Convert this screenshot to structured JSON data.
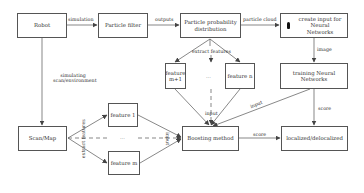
{
  "nodes": {
    "robot": "Robot",
    "particle_filter": "Particle filter",
    "particle_prob": "Particle probability distribution",
    "create_input": "create input for Neural Networks",
    "feature_m1": "feature m+1",
    "feature_n": "feature n",
    "training_nn": "training Neural Networks",
    "scan_map": "Scan/Map",
    "feature_1": "feature 1",
    "feature_m": "feature m",
    "boosting": "Boosting method",
    "localized": "localized/delocalized"
  },
  "edges": {
    "simulation": "simulation",
    "outputs": "outputs",
    "particle_cloud": "particle cloud",
    "image": "image",
    "simulating_scan": "simulating scan/environment",
    "extract_features_top": "extract features",
    "extract_features_left": "extract features",
    "input_top": "input",
    "input_left": "input",
    "input_nn": "input",
    "score_nn": "score",
    "score_boost": "score"
  },
  "ellipsis": "..."
}
